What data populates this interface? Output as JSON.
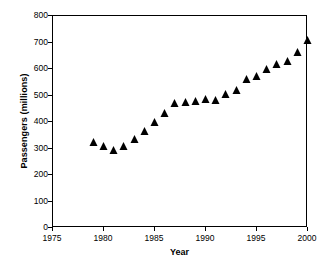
{
  "chart_data": {
    "type": "scatter",
    "title": "",
    "xlabel": "Year",
    "ylabel": "Passengers (millions)",
    "xlim": [
      1975,
      2000
    ],
    "ylim": [
      0,
      800
    ],
    "xticks": [
      1975,
      1980,
      1985,
      1990,
      1995,
      2000
    ],
    "yticks": [
      0,
      100,
      200,
      300,
      400,
      500,
      600,
      700,
      800
    ],
    "xtick_labels": [
      "1975",
      "1980",
      "1985",
      "1990",
      "1995",
      "2000"
    ],
    "ytick_labels": [
      "0",
      "100",
      "200",
      "300",
      "400",
      "500",
      "600",
      "700",
      "800"
    ],
    "grid": false,
    "legend": false,
    "marker": "triangle-up",
    "marker_color": "#000000",
    "series": [
      {
        "name": "Passengers",
        "x": [
          1979,
          1980,
          1981,
          1982,
          1983,
          1984,
          1985,
          1986,
          1987,
          1988,
          1989,
          1990,
          1991,
          1992,
          1993,
          1994,
          1995,
          1996,
          1997,
          1998,
          1999,
          2000
        ],
        "values": [
          325,
          310,
          293,
          308,
          337,
          365,
          400,
          435,
          472,
          476,
          479,
          486,
          482,
          505,
          520,
          561,
          575,
          599,
          619,
          630,
          664,
          710
        ]
      }
    ]
  },
  "figure": {
    "background_color": "#ffffff",
    "axis_color": "#000000",
    "text_color": "#000000"
  }
}
